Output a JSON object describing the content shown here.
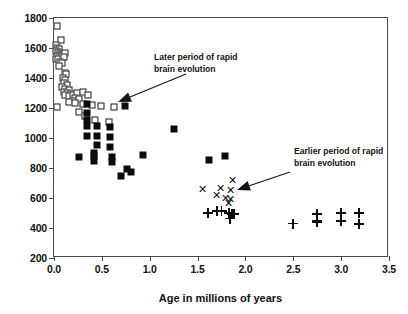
{
  "chart_data": {
    "type": "scatter",
    "title": "",
    "xlabel": "Age in millions of years",
    "ylabel": "Cranial capacity (cm³)",
    "xlim": [
      0.0,
      3.5
    ],
    "ylim": [
      200,
      1800
    ],
    "xticks": [
      "0.0",
      "0.5",
      "1.0",
      "1.5",
      "2.0",
      "2.5",
      "3.0",
      "3.5"
    ],
    "xtick_values": [
      0.0,
      0.5,
      1.0,
      1.5,
      2.0,
      2.5,
      3.0,
      3.5
    ],
    "yticks": [
      "200",
      "400",
      "600",
      "800",
      "1000",
      "1200",
      "1400",
      "1600",
      "1800"
    ],
    "ytick_values": [
      200,
      400,
      600,
      800,
      1000,
      1200,
      1400,
      1600,
      1800
    ],
    "grid": false,
    "legend": "none",
    "series": [
      {
        "name": "open-square",
        "marker": "open-square",
        "points": [
          [
            0.03,
            1750
          ],
          [
            0.07,
            1655
          ],
          [
            0.02,
            1620
          ],
          [
            0.03,
            1600
          ],
          [
            0.05,
            1595
          ],
          [
            0.02,
            1580
          ],
          [
            0.04,
            1572
          ],
          [
            0.06,
            1568
          ],
          [
            0.08,
            1562
          ],
          [
            0.03,
            1548
          ],
          [
            0.05,
            1545
          ],
          [
            0.07,
            1540
          ],
          [
            0.02,
            1530
          ],
          [
            0.04,
            1525
          ],
          [
            0.09,
            1555
          ],
          [
            0.12,
            1570
          ],
          [
            0.1,
            1538
          ],
          [
            0.06,
            1510
          ],
          [
            0.08,
            1500
          ],
          [
            0.05,
            1478
          ],
          [
            0.11,
            1432
          ],
          [
            0.13,
            1425
          ],
          [
            0.09,
            1400
          ],
          [
            0.12,
            1390
          ],
          [
            0.1,
            1370
          ],
          [
            0.14,
            1355
          ],
          [
            0.08,
            1340
          ],
          [
            0.12,
            1325
          ],
          [
            0.16,
            1318
          ],
          [
            0.1,
            1305
          ],
          [
            0.14,
            1300
          ],
          [
            0.18,
            1295
          ],
          [
            0.12,
            1285
          ],
          [
            0.16,
            1280
          ],
          [
            0.2,
            1290
          ],
          [
            0.24,
            1300
          ],
          [
            0.3,
            1310
          ],
          [
            0.36,
            1290
          ],
          [
            0.22,
            1268
          ],
          [
            0.26,
            1262
          ],
          [
            0.2,
            1250
          ],
          [
            0.16,
            1240
          ],
          [
            0.03,
            1205
          ],
          [
            0.22,
            1232
          ],
          [
            0.3,
            1225
          ],
          [
            0.4,
            1222
          ],
          [
            0.49,
            1215
          ],
          [
            0.63,
            1210
          ],
          [
            0.26,
            1175
          ],
          [
            0.32,
            1145
          ],
          [
            0.43,
            1120
          ],
          [
            0.57,
            1108
          ]
        ]
      },
      {
        "name": "filled-square",
        "marker": "filled-square",
        "points": [
          [
            0.34,
            1228
          ],
          [
            0.74,
            1215
          ],
          [
            0.34,
            1165
          ],
          [
            0.34,
            1120
          ],
          [
            0.34,
            1080
          ],
          [
            0.45,
            1078
          ],
          [
            0.59,
            1075
          ],
          [
            1.25,
            1060
          ],
          [
            0.34,
            1012
          ],
          [
            0.45,
            1012
          ],
          [
            0.59,
            1005
          ],
          [
            0.45,
            955
          ],
          [
            0.59,
            942
          ],
          [
            0.26,
            872
          ],
          [
            0.42,
            900
          ],
          [
            0.42,
            880
          ],
          [
            0.42,
            845
          ],
          [
            0.61,
            875
          ],
          [
            0.61,
            843
          ],
          [
            0.7,
            748
          ],
          [
            0.76,
            795
          ],
          [
            0.8,
            772
          ],
          [
            0.93,
            888
          ],
          [
            1.62,
            855
          ],
          [
            1.79,
            880
          ]
        ]
      },
      {
        "name": "asterisk",
        "marker": "asterisk",
        "points": [
          [
            1.86,
            720
          ],
          [
            1.55,
            660
          ],
          [
            1.74,
            668
          ],
          [
            1.84,
            655
          ],
          [
            1.7,
            620
          ],
          [
            1.79,
            600
          ],
          [
            1.84,
            592
          ],
          [
            1.82,
            570
          ]
        ]
      },
      {
        "name": "plus",
        "marker": "plus",
        "points": [
          [
            1.61,
            500
          ],
          [
            1.7,
            512
          ],
          [
            1.75,
            512
          ],
          [
            1.83,
            498
          ],
          [
            1.86,
            495
          ],
          [
            1.88,
            492
          ],
          [
            1.84,
            462
          ],
          [
            2.5,
            430
          ],
          [
            2.75,
            492
          ],
          [
            2.75,
            445
          ],
          [
            2.75,
            437
          ],
          [
            3.0,
            500
          ],
          [
            3.0,
            448
          ],
          [
            3.19,
            500
          ],
          [
            3.19,
            425
          ]
        ]
      }
    ],
    "annotations": [
      {
        "name": "later-period-annotation",
        "text": "Later period of rapid\nbrain evolution",
        "text_x": 154,
        "text_y": 52,
        "arrow_from_x": 186,
        "arrow_from_y": 74,
        "arrow_to_x": 118,
        "arrow_to_y": 102
      },
      {
        "name": "earlier-period-annotation",
        "text": "Earlier period of rapid\nbrain evolution",
        "text_x": 294,
        "text_y": 146,
        "arrow_from_x": 290,
        "arrow_from_y": 172,
        "arrow_to_x": 237,
        "arrow_to_y": 190
      }
    ]
  }
}
